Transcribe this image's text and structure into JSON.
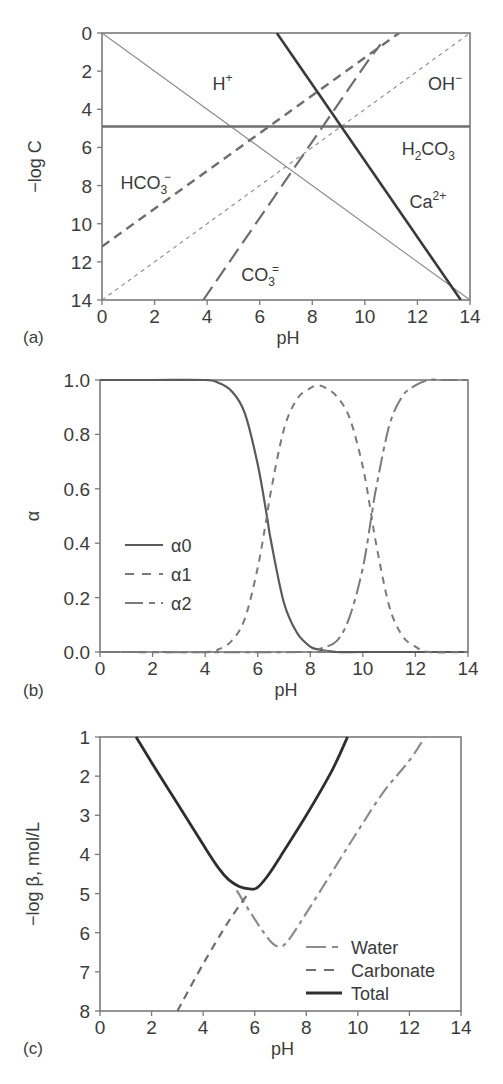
{
  "chart_data": [
    {
      "panel": "(a)",
      "type": "line",
      "xlabel": "pH",
      "ylabel": "−log C",
      "xlim": [
        0,
        14
      ],
      "ylim": [
        0,
        14
      ],
      "y_inverted": true,
      "xticks": [
        0,
        2,
        4,
        6,
        8,
        10,
        12,
        14
      ],
      "yticks": [
        0,
        2,
        4,
        6,
        8,
        10,
        12,
        14
      ],
      "grid": false,
      "series": [
        {
          "name": "H+",
          "label": "H",
          "sup": "+",
          "style": "thin-solid",
          "color": "#8a8a8a",
          "x": [
            0,
            14
          ],
          "y": [
            0,
            14
          ],
          "label_pos": [
            4.2,
            3.0
          ]
        },
        {
          "name": "OH-",
          "label": "OH",
          "sup": "−",
          "style": "short-dash",
          "color": "#8a8a8a",
          "x": [
            0,
            14
          ],
          "y": [
            14,
            0
          ],
          "label_pos": [
            12.4,
            3.0
          ]
        },
        {
          "name": "H2CO3",
          "label": "H",
          "sub1": "2",
          "mid": "CO",
          "sub2": "3",
          "style": "thick-solid",
          "color": "#6e6e6e",
          "x": [
            0,
            14
          ],
          "y": [
            4.9,
            4.9
          ],
          "label_pos": [
            11.4,
            6.4
          ]
        },
        {
          "name": "Ca2+",
          "label": "Ca",
          "sup": "2+",
          "style": "thick-solid",
          "color": "#3a3a3a",
          "x": [
            6.65,
            13.65
          ],
          "y": [
            0,
            14
          ],
          "label_pos": [
            11.7,
            9.2
          ]
        },
        {
          "name": "HCO3-",
          "label": "HCO",
          "sub": "3",
          "sup": "−",
          "style": "medium-dash",
          "color": "#6e6e6e",
          "x": [
            0,
            11.3
          ],
          "y": [
            11.2,
            0
          ],
          "label_pos": [
            0.7,
            8.2
          ]
        },
        {
          "name": "CO3=",
          "label": "CO",
          "sub": "3",
          "sup": "=",
          "style": "long-dash",
          "color": "#6e6e6e",
          "x": [
            3.85,
            10.2,
            10.6
          ],
          "y": [
            14,
            1.3,
            0.6
          ],
          "label_pos": [
            5.3,
            13.0
          ]
        }
      ]
    },
    {
      "panel": "(b)",
      "type": "line",
      "xlabel": "pH",
      "ylabel": "α",
      "xlim": [
        0,
        14
      ],
      "ylim": [
        0,
        1
      ],
      "xticks": [
        0,
        2,
        4,
        6,
        8,
        10,
        12,
        14
      ],
      "yticks": [
        "0.0",
        "0.2",
        "0.4",
        "0.6",
        "0.8",
        "1.0"
      ],
      "grid": false,
      "pKa": [
        6.35,
        10.33
      ],
      "legend": [
        {
          "label": "α0",
          "style": "solid"
        },
        {
          "label": "α1",
          "style": "short-dash"
        },
        {
          "label": "α2",
          "style": "long-short-dash"
        }
      ],
      "series": [
        {
          "name": "α0",
          "x": [
            0,
            2,
            4,
            4.5,
            5,
            5.5,
            6,
            6.35,
            6.5,
            7,
            7.5,
            8,
            8.3,
            9,
            10,
            12,
            14
          ],
          "y": [
            1.0,
            1.0,
            1.0,
            0.99,
            0.96,
            0.88,
            0.69,
            0.5,
            0.41,
            0.18,
            0.07,
            0.02,
            0.01,
            0.0,
            0.0,
            0.0,
            0.0
          ]
        },
        {
          "name": "α1",
          "x": [
            0,
            4,
            4.5,
            5,
            5.5,
            6,
            6.35,
            6.5,
            7,
            7.5,
            8,
            8.3,
            8.6,
            9,
            9.5,
            10,
            10.33,
            10.5,
            11,
            11.5,
            12,
            12.5,
            14
          ],
          "y": [
            0,
            0.0,
            0.01,
            0.04,
            0.12,
            0.31,
            0.5,
            0.59,
            0.82,
            0.93,
            0.97,
            0.98,
            0.97,
            0.94,
            0.86,
            0.68,
            0.5,
            0.4,
            0.17,
            0.06,
            0.02,
            0.0,
            0.0
          ]
        },
        {
          "name": "α2",
          "x": [
            0,
            8,
            8.3,
            9,
            9.5,
            10,
            10.33,
            10.5,
            11,
            11.5,
            12,
            12.5,
            13,
            14
          ],
          "y": [
            0,
            0.0,
            0.01,
            0.04,
            0.13,
            0.31,
            0.5,
            0.6,
            0.83,
            0.94,
            0.98,
            1.0,
            1.0,
            1.0
          ]
        }
      ]
    },
    {
      "panel": "(c)",
      "type": "line",
      "xlabel": "pH",
      "ylabel": "−log β, mol/L",
      "xlim": [
        0,
        14
      ],
      "ylim": [
        1,
        8
      ],
      "y_inverted": true,
      "xticks": [
        0,
        2,
        4,
        6,
        8,
        10,
        12,
        14
      ],
      "yticks": [
        1,
        2,
        3,
        4,
        5,
        6,
        7,
        8
      ],
      "grid": false,
      "legend": [
        {
          "label": "Water",
          "style": "long-short-dash",
          "color": "#8a8a8a"
        },
        {
          "label": "Carbonate",
          "style": "dash",
          "color": "#6e6e6e"
        },
        {
          "label": "Total",
          "style": "thick-solid",
          "color": "#2e2e2e"
        }
      ],
      "series": [
        {
          "name": "Water",
          "x": [
            5.3,
            5.8,
            6.3,
            6.7,
            7.0,
            7.3,
            8,
            9,
            10,
            11,
            12,
            12.6
          ],
          "y": [
            4.92,
            5.45,
            5.95,
            6.28,
            6.35,
            6.2,
            5.5,
            4.45,
            3.4,
            2.4,
            1.6,
            1.0
          ]
        },
        {
          "name": "Carbonate",
          "x": [
            3.0,
            4.0,
            5.0,
            5.8
          ],
          "y": [
            8.0,
            6.8,
            5.7,
            4.95
          ]
        },
        {
          "name": "Total",
          "x": [
            1.4,
            2,
            3,
            4,
            4.6,
            5,
            5.4,
            5.8,
            6.1,
            6.5,
            7,
            8,
            9,
            9.6
          ],
          "y": [
            1.0,
            1.65,
            2.7,
            3.75,
            4.35,
            4.65,
            4.82,
            4.88,
            4.85,
            4.55,
            4.05,
            3.0,
            1.85,
            1.0
          ]
        }
      ]
    }
  ],
  "panels": {
    "a": {
      "tag": "(a)",
      "xlabel": "pH",
      "ylabel": "−log C"
    },
    "b": {
      "tag": "(b)",
      "xlabel": "pH",
      "ylabel": "α"
    },
    "c": {
      "tag": "(c)",
      "xlabel": "pH",
      "ylabel": "−log β, mol/L"
    }
  }
}
